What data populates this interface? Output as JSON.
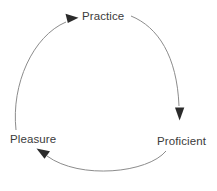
{
  "diagram": {
    "type": "cycle",
    "title": "",
    "background_color": "#ffffff",
    "stroke_color": "#8c8c8c",
    "arrowhead_color": "#2b2b2b",
    "text_color": "#3b3b3b",
    "nodes": [
      {
        "id": "practice",
        "label": "Practice"
      },
      {
        "id": "proficient",
        "label": "Proficient"
      },
      {
        "id": "pleasure",
        "label": "Pleasure"
      }
    ],
    "edges": [
      {
        "from": "practice",
        "to": "proficient",
        "label": ""
      },
      {
        "from": "proficient",
        "to": "pleasure",
        "label": ""
      },
      {
        "from": "pleasure",
        "to": "practice",
        "label": ""
      }
    ]
  }
}
